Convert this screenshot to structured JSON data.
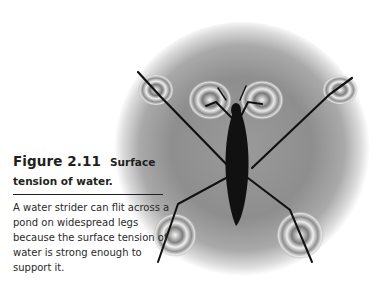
{
  "figure": {
    "number": "Figure 2.11",
    "title_line1": "Surface",
    "title_line2": "tension of water.",
    "caption": "A water strider can flit across a pond on widespread legs because the surface tension of water is strong enough to support it.",
    "image_subject": "water-strider-on-water-surface",
    "colors": {
      "text": "#231f20",
      "insect": "#111111",
      "water_mid": "#8a8a8a",
      "background": "#ffffff"
    }
  }
}
